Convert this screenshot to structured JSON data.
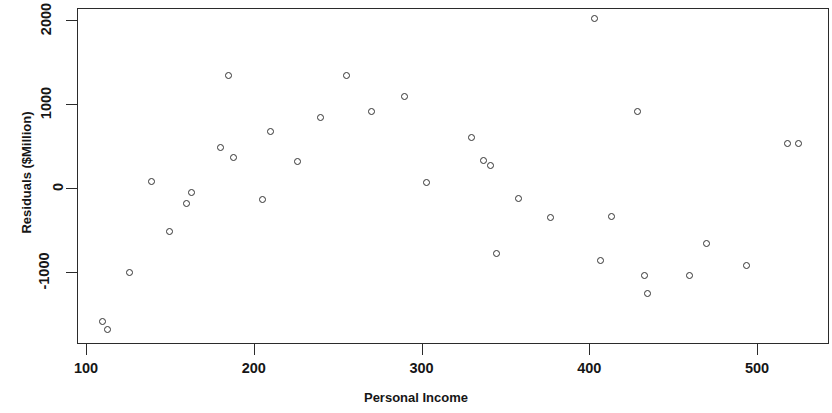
{
  "chart_data": {
    "type": "scatter",
    "title": "",
    "xlabel": "Personal Income",
    "ylabel": "Residuals ($Million)",
    "xlim": [
      94,
      543
    ],
    "ylim": [
      -2140,
      2135
    ],
    "xticks": [
      100,
      200,
      300,
      400,
      500
    ],
    "yticks": [
      -1000,
      0,
      1000,
      2000
    ],
    "xtick_labels": [
      "100",
      "200",
      "300",
      "400",
      "500"
    ],
    "ytick_labels": [
      "-1000",
      "0",
      "1000",
      "2000"
    ],
    "grid": false,
    "legend": null,
    "marker": "open-circle",
    "marker_color": "#333333",
    "frame_color": "#2b2b2b",
    "background": "#ffffff",
    "n_points": 35,
    "points": [
      {
        "x": 110,
        "y": -1580
      },
      {
        "x": 113,
        "y": -1680
      },
      {
        "x": 126,
        "y": -1000
      },
      {
        "x": 139,
        "y": 80
      },
      {
        "x": 150,
        "y": -520
      },
      {
        "x": 160,
        "y": -180
      },
      {
        "x": 163,
        "y": -50
      },
      {
        "x": 180,
        "y": 480
      },
      {
        "x": 185,
        "y": 1330
      },
      {
        "x": 188,
        "y": 360
      },
      {
        "x": 205,
        "y": -140
      },
      {
        "x": 210,
        "y": 670
      },
      {
        "x": 226,
        "y": 320
      },
      {
        "x": 240,
        "y": 840
      },
      {
        "x": 255,
        "y": 1340
      },
      {
        "x": 270,
        "y": 910
      },
      {
        "x": 290,
        "y": 1090
      },
      {
        "x": 303,
        "y": 70
      },
      {
        "x": 330,
        "y": 600
      },
      {
        "x": 337,
        "y": 330
      },
      {
        "x": 341,
        "y": 270
      },
      {
        "x": 345,
        "y": -780
      },
      {
        "x": 358,
        "y": -130
      },
      {
        "x": 377,
        "y": -350
      },
      {
        "x": 403,
        "y": 2010
      },
      {
        "x": 407,
        "y": -860
      },
      {
        "x": 413,
        "y": -340
      },
      {
        "x": 429,
        "y": 910
      },
      {
        "x": 433,
        "y": -1040
      },
      {
        "x": 435,
        "y": -1250
      },
      {
        "x": 460,
        "y": -1040
      },
      {
        "x": 470,
        "y": -660
      },
      {
        "x": 494,
        "y": -920
      },
      {
        "x": 518,
        "y": 530
      },
      {
        "x": 525,
        "y": 530
      }
    ]
  }
}
